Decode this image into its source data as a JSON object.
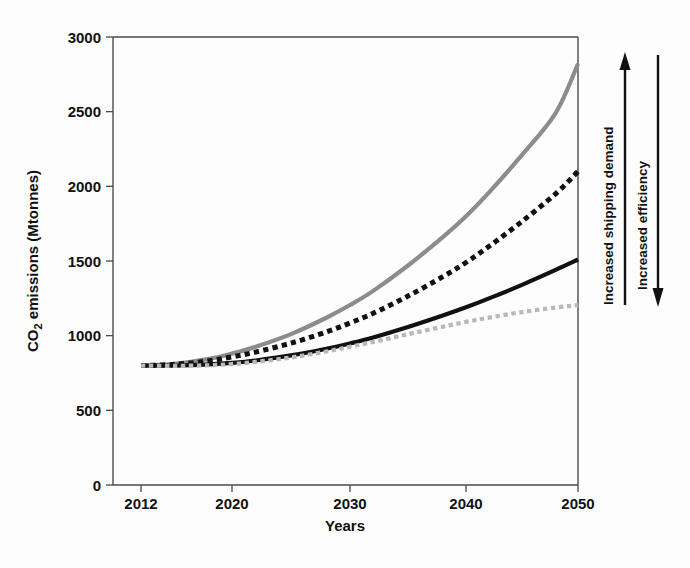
{
  "chart_data": {
    "type": "line",
    "title": "",
    "xlabel": "Years",
    "ylabel": "CO2 emissions (Mtonnes)",
    "ylabel_parts": {
      "pre": "CO",
      "sub": "2",
      "post": " emissions (Mtonnes)"
    },
    "xlim": [
      2012,
      2050
    ],
    "ylim": [
      0,
      3000
    ],
    "grid": false,
    "legend": "none",
    "xticks": [
      "2012",
      "2020",
      "2030",
      "2040",
      "2050"
    ],
    "xtick_values": [
      2012,
      2020,
      2030,
      2040,
      2050
    ],
    "yticks": [
      "0",
      "500",
      "1000",
      "1500",
      "2000",
      "2500",
      "3000"
    ],
    "ytick_values": [
      0,
      500,
      1000,
      1500,
      2000,
      2500,
      3000
    ],
    "x": [
      2012,
      2015,
      2018,
      2020,
      2022,
      2025,
      2028,
      2030,
      2032,
      2035,
      2038,
      2040,
      2042,
      2045,
      2048,
      2050
    ],
    "series": [
      {
        "name": "High demand / low efficiency",
        "style": "solid",
        "color": "#8c8c8c",
        "width": 4.2,
        "values": [
          800,
          812,
          845,
          880,
          925,
          1010,
          1120,
          1205,
          1300,
          1470,
          1660,
          1800,
          1955,
          2210,
          2490,
          2820
        ]
      },
      {
        "name": "Mid-high scenario",
        "style": "dashed",
        "color": "#111111",
        "width": 5.0,
        "values": [
          800,
          808,
          832,
          858,
          890,
          950,
          1025,
          1085,
          1150,
          1265,
          1395,
          1490,
          1595,
          1765,
          1950,
          2100
        ]
      },
      {
        "name": "Mid-low scenario",
        "style": "solid",
        "color": "#111111",
        "width": 4.2,
        "values": [
          800,
          800,
          808,
          818,
          834,
          868,
          912,
          948,
          988,
          1058,
          1135,
          1190,
          1248,
          1340,
          1440,
          1510
        ]
      },
      {
        "name": "Low demand / high efficiency",
        "style": "dashed",
        "color": "#b9b9b9",
        "width": 4.2,
        "values": [
          800,
          798,
          802,
          810,
          824,
          854,
          894,
          926,
          958,
          1010,
          1060,
          1092,
          1120,
          1158,
          1188,
          1205
        ]
      }
    ],
    "annotations": [
      {
        "id": "increased-shipping-demand",
        "label": "Increased shipping demand",
        "direction": "up"
      },
      {
        "id": "increased-efficiency",
        "label": "Increased efficiency",
        "direction": "down"
      }
    ]
  }
}
